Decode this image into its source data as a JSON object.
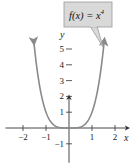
{
  "chart_data": {
    "type": "line",
    "title": "",
    "function": "x^4",
    "annotation": {
      "label_lhs": "f(x) = x",
      "label_exp": "4"
    },
    "xlabel": "x",
    "ylabel": "y",
    "xlim": [
      -2.5,
      2.5
    ],
    "ylim": [
      -1.5,
      6
    ],
    "x_ticks": [
      -2,
      -1,
      1,
      2
    ],
    "y_ticks": [
      -1,
      1,
      2,
      3,
      4,
      5
    ],
    "x_tick_labels": [
      "−2",
      "−1",
      "1",
      "2"
    ],
    "y_tick_labels": [
      "−1",
      "1",
      "2",
      "3",
      "4",
      "5"
    ],
    "series": [
      {
        "name": "f(x) = x^4",
        "x_range": [
          -1.53,
          1.53
        ],
        "color": "#8a8a8a"
      }
    ],
    "grid": false,
    "colors": {
      "curve": "#8a8a8a",
      "axis": "#333333",
      "callout_fill": "#d9d9d9",
      "callout_border": "#9a9a9a"
    }
  }
}
